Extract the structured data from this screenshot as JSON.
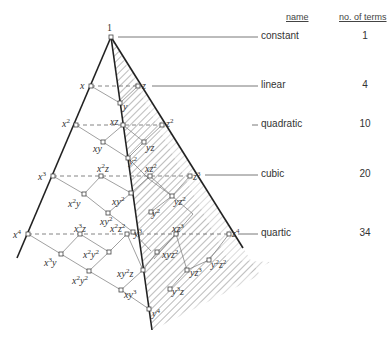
{
  "table": {
    "headers": {
      "name": "name",
      "count": "no. of terms"
    },
    "rows": [
      {
        "name": "constant",
        "count": "1"
      },
      {
        "name": "linear",
        "count": "4"
      },
      {
        "name": "quadratic",
        "count": "10"
      },
      {
        "name": "cubic",
        "count": "20"
      },
      {
        "name": "quartic",
        "count": "34"
      }
    ]
  },
  "terms": {
    "constant": "1",
    "x": "x",
    "y": "y",
    "z": "z",
    "x2": "x",
    "xz": "xz",
    "z2": "z",
    "xy": "xy",
    "yz": "yz",
    "y2": "y",
    "x3": "x",
    "x2z": "x",
    "xz2": "xz",
    "z3": "z",
    "x2y": "x",
    "xy2": "xy",
    "yz2": "yz",
    "y3": "y",
    "y2z": "y",
    "xyz": "xyz",
    "x4": "x",
    "x3z": "x",
    "x2z2": "x",
    "xz3": "xz",
    "z4": "z",
    "x3y": "x",
    "x2y2": "x",
    "xy3": "xy",
    "y4": "y",
    "xy2z": "xy",
    "xyz2": "xyz",
    "y2z2": "y",
    "yz3": "yz",
    "y3z": "y"
  },
  "colors": {
    "line": "#222222",
    "thin": "#777777",
    "hatch": "#999999"
  }
}
